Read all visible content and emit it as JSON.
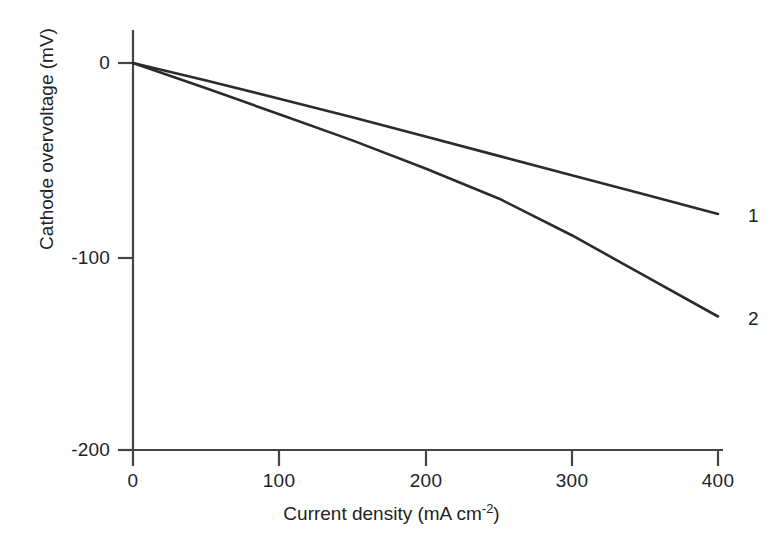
{
  "chart_data": {
    "type": "line",
    "title": "",
    "xlabel_text": "Current density (mA cm",
    "xlabel_exponent": "-2",
    "xlabel_close": ")",
    "xlabel": "Current density (mA cm^-2)",
    "ylabel": "Cathode overvoltage (mV)",
    "xlim": [
      0,
      400
    ],
    "ylim": [
      -200,
      0
    ],
    "xticks": [
      0,
      100,
      200,
      300,
      400
    ],
    "xtick_labels": [
      "0",
      "100",
      "200",
      "300",
      "400"
    ],
    "yticks": [
      0,
      -100,
      -200
    ],
    "ytick_labels": [
      "0",
      "-100",
      "-200"
    ],
    "grid": false,
    "legend_position": "right-end-of-curve",
    "line_color": "#2b2b2b",
    "axis_color": "#444444",
    "series": [
      {
        "name": "1",
        "label": "1",
        "x": [
          0,
          50,
          100,
          150,
          200,
          250,
          300,
          350,
          400
        ],
        "y": [
          0,
          -9,
          -18.5,
          -28,
          -38,
          -48,
          -58,
          -68,
          -78
        ]
      },
      {
        "name": "2",
        "label": "2",
        "x": [
          0,
          50,
          100,
          150,
          200,
          250,
          300,
          350,
          400
        ],
        "y": [
          0,
          -13,
          -26.5,
          -40,
          -54.5,
          -70,
          -89,
          -110,
          -131
        ]
      }
    ]
  },
  "axes": {
    "x_axis_name": "x-axis",
    "y_axis_name": "y-axis"
  }
}
